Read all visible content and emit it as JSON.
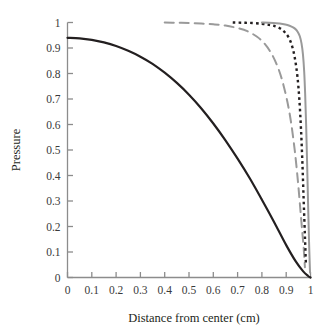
{
  "chart_data": {
    "type": "line",
    "title": "",
    "subtitle": "",
    "xlabel": "Distance from center (cm)",
    "ylabel": "Pressure",
    "xlim": [
      0,
      1
    ],
    "ylim": [
      0,
      1
    ],
    "grid": false,
    "legend": "none",
    "xticks": [
      "0",
      "0.1",
      "0.2",
      "0.3",
      "0.4",
      "0.5",
      "0.6",
      "0.7",
      "0.8",
      "0.9",
      "1"
    ],
    "xtick_values": [
      0,
      0.1,
      0.2,
      0.3,
      0.4,
      0.5,
      0.6,
      0.7,
      0.8,
      0.9,
      1
    ],
    "yticks": [
      "0",
      "0.1",
      "0.2",
      "0.3",
      "0.4",
      "0.5",
      "0.6",
      "0.7",
      "0.8",
      "0.9",
      "1"
    ],
    "ytick_values": [
      0,
      0.1,
      0.2,
      0.3,
      0.4,
      0.5,
      0.6,
      0.7,
      0.8,
      0.9,
      1
    ],
    "series": [
      {
        "name": "curve-1-black-solid",
        "style": "solid",
        "color": "#231f20",
        "width": 2.2,
        "x": [
          0.0,
          0.05,
          0.1,
          0.15,
          0.2,
          0.25,
          0.3,
          0.35,
          0.4,
          0.45,
          0.5,
          0.55,
          0.6,
          0.65,
          0.7,
          0.75,
          0.8,
          0.85,
          0.9,
          0.94,
          0.97,
          0.99,
          1.0
        ],
        "values": [
          0.94,
          0.938,
          0.932,
          0.922,
          0.908,
          0.889,
          0.866,
          0.838,
          0.803,
          0.763,
          0.717,
          0.664,
          0.604,
          0.538,
          0.466,
          0.389,
          0.305,
          0.218,
          0.127,
          0.062,
          0.024,
          0.006,
          0.0
        ]
      },
      {
        "name": "curve-2-gray-dashed",
        "style": "dashed",
        "color": "#9a9a9a",
        "width": 2.0,
        "x": [
          0.4,
          0.45,
          0.5,
          0.55,
          0.6,
          0.65,
          0.7,
          0.74,
          0.78,
          0.81,
          0.84,
          0.865,
          0.885,
          0.905,
          0.92,
          0.935,
          0.948,
          0.958,
          0.966,
          0.972,
          0.977
        ],
        "values": [
          1.0,
          0.999,
          0.998,
          0.996,
          0.993,
          0.988,
          0.978,
          0.966,
          0.944,
          0.918,
          0.877,
          0.826,
          0.768,
          0.688,
          0.608,
          0.5,
          0.38,
          0.27,
          0.18,
          0.115,
          0.04
        ]
      },
      {
        "name": "curve-3-black-dotted",
        "style": "dotted",
        "color": "#231f20",
        "width": 2.4,
        "x": [
          0.68,
          0.72,
          0.76,
          0.8,
          0.83,
          0.855,
          0.878,
          0.896,
          0.912,
          0.925,
          0.936,
          0.946,
          0.954,
          0.961,
          0.967,
          0.972,
          0.977,
          0.981
        ],
        "values": [
          1.0,
          0.999,
          0.998,
          0.995,
          0.991,
          0.985,
          0.975,
          0.96,
          0.938,
          0.905,
          0.858,
          0.79,
          0.7,
          0.58,
          0.44,
          0.3,
          0.165,
          0.055
        ]
      },
      {
        "name": "curve-4-gray-solid",
        "style": "solid",
        "color": "#9a9a9a",
        "width": 2.0,
        "x": [
          0.8,
          0.83,
          0.86,
          0.885,
          0.905,
          0.922,
          0.936,
          0.947,
          0.956,
          0.963,
          0.969,
          0.974,
          0.978,
          0.982,
          0.986,
          0.99,
          0.994,
          0.998
        ],
        "values": [
          1.0,
          0.999,
          0.997,
          0.994,
          0.99,
          0.984,
          0.976,
          0.964,
          0.946,
          0.918,
          0.874,
          0.808,
          0.72,
          0.6,
          0.45,
          0.29,
          0.14,
          0.02
        ]
      }
    ]
  },
  "axes": {
    "x_title": "Distance from center (cm)",
    "y_title": "Pressure"
  }
}
